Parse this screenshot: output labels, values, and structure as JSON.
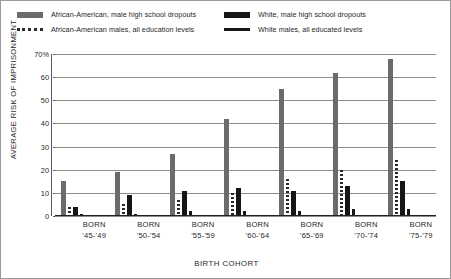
{
  "legend": {
    "entries": [
      {
        "label": "African-American, male high school dropouts",
        "marker": "filled-bar",
        "color": "#6b6b6b"
      },
      {
        "label": "White, male high school dropouts",
        "marker": "filled-bar",
        "color": "#161616"
      },
      {
        "label": "African-American males, all education levels",
        "marker": "dotted-line",
        "color": "#2a2a2a"
      },
      {
        "label": "White males, all educated levels",
        "marker": "solid-line",
        "color": "#161616"
      }
    ]
  },
  "axes": {
    "y_title": "AVERAGE RISK OF IMPRISONMENT",
    "x_title": "BIRTH COHORT",
    "y_ticks": [
      "70%",
      "60",
      "50",
      "40",
      "30",
      "20",
      "10",
      "0"
    ]
  },
  "chart_data": {
    "type": "bar",
    "title": "",
    "xlabel": "BIRTH COHORT",
    "ylabel": "AVERAGE RISK OF IMPRISONMENT",
    "ylim": [
      0,
      70
    ],
    "yticks": [
      0,
      10,
      20,
      30,
      40,
      50,
      60,
      70
    ],
    "ytick_labels": [
      "0",
      "10",
      "20",
      "30",
      "40",
      "50",
      "60",
      "70%"
    ],
    "grid": true,
    "legend_position": "top",
    "unit": "percent",
    "categories": [
      "BORN '45-'49",
      "BORN '50-'54",
      "BORN '55-'59",
      "BORN '60-'64",
      "BORN '65-'69",
      "BORN '70-'74",
      "BORN '75-'79"
    ],
    "category_lines": [
      [
        "BORN",
        "'45-'49"
      ],
      [
        "BORN",
        "'50-'54"
      ],
      [
        "BORN",
        "'55-'59"
      ],
      [
        "BORN",
        "'60-'64"
      ],
      [
        "BORN",
        "'65-'69"
      ],
      [
        "BORN",
        "'70-'74"
      ],
      [
        "BORN",
        "'75-'79"
      ]
    ],
    "series": [
      {
        "name": "African-American, male high school dropouts",
        "style": "filled-bar",
        "color": "#6b6b6b",
        "values": [
          15,
          19,
          27,
          42,
          55,
          62,
          68
        ]
      },
      {
        "name": "African-American males, all education levels",
        "style": "dotted-line",
        "color": "#2a2a2a",
        "values": [
          4,
          5,
          7,
          10,
          16,
          20,
          24
        ]
      },
      {
        "name": "White, male high school dropouts",
        "style": "filled-bar",
        "color": "#161616",
        "values": [
          4,
          9,
          11,
          12,
          11,
          13,
          15
        ]
      },
      {
        "name": "White males, all educated levels",
        "style": "solid-line",
        "color": "#161616",
        "values": [
          1,
          1,
          2,
          2,
          2,
          3,
          3
        ]
      }
    ]
  }
}
